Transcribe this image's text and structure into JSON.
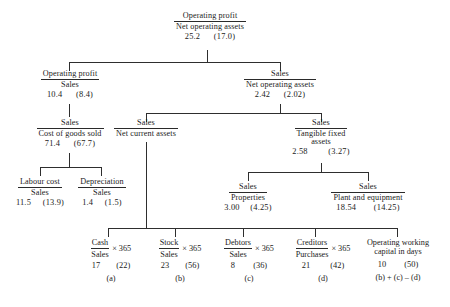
{
  "diagram": {
    "nodes": {
      "root": {
        "numerator": "Operating profit",
        "denominator": "Net operating assets",
        "value": "25.2",
        "comparison": "(17.0)"
      },
      "margin": {
        "numerator": "Operating profit",
        "denominator": "Sales",
        "value": "10.4",
        "comparison": "(8.4)"
      },
      "asset_turn": {
        "numerator": "Sales",
        "denominator": "Net operating assets",
        "value": "2.42",
        "comparison": "(2.02)"
      },
      "cogs": {
        "numerator": "Sales",
        "denominator": "Cost of goods sold",
        "value": "71.4",
        "comparison": "(67.7)"
      },
      "net_current_assets": {
        "numerator": "Sales",
        "denominator": "Net current assets",
        "value": "",
        "comparison": ""
      },
      "tangible_fixed": {
        "numerator": "Sales",
        "denominator": "Tangible fixed",
        "denominator2": "assets",
        "value": "2.58",
        "comparison": "(3.27)"
      },
      "labour": {
        "numerator": "Labour cost",
        "denominator": "Sales",
        "value": "11.5",
        "comparison": "(13.9)"
      },
      "depreciation": {
        "numerator": "Depreciation",
        "denominator": "Sales",
        "value": "1.4",
        "comparison": "(1.5)"
      },
      "properties": {
        "numerator": "Sales",
        "denominator": "Properties",
        "value": "3.00",
        "comparison": "(4.25)"
      },
      "plant": {
        "numerator": "Sales",
        "denominator": "Plant and equipment",
        "value": "18.54",
        "comparison": "(14.25)"
      }
    },
    "leaves": [
      {
        "numerator": "Cash",
        "denominator": "Sales",
        "multiplier": "× 365",
        "value": "17",
        "comparison": "(22)",
        "tag": "(a)"
      },
      {
        "numerator": "Stock",
        "denominator": "Sales",
        "multiplier": "× 365",
        "value": "23",
        "comparison": "(56)",
        "tag": "(b)"
      },
      {
        "numerator": "Debtors",
        "denominator": "Sales",
        "multiplier": "× 365",
        "value": "8",
        "comparison": "(36)",
        "tag": "(c)"
      },
      {
        "numerator": "Creditors",
        "denominator": "Purchases",
        "multiplier": "× 365",
        "value": "21",
        "comparison": "(42)",
        "tag": "(d)"
      },
      {
        "label_line1": "Operating working",
        "label_line2": "capital in days",
        "value": "10",
        "comparison": "(50)",
        "tag": "(b) + (c) – (d)"
      }
    ]
  }
}
